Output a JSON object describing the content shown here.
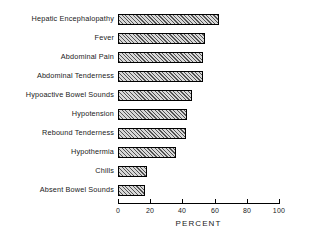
{
  "chart_data": {
    "type": "bar",
    "orientation": "horizontal",
    "title": "",
    "xlabel": "PERCENT",
    "ylabel": "",
    "xlim": [
      0,
      100
    ],
    "xticks": [
      0,
      20,
      40,
      60,
      80,
      100
    ],
    "xtick_labels": [
      "0",
      "20",
      "40",
      "60",
      "80",
      "100"
    ],
    "grid": false,
    "legend": false,
    "categories": [
      "Hepatic Encephalopathy",
      "Fever",
      "Abdominal Pain",
      "Abdominal Tenderness",
      "Hypoactive Bowel Sounds",
      "Hypotension",
      "Rebound Tenderness",
      "Hypothermia",
      "Chills",
      "Absent Bowel Sounds"
    ],
    "values": [
      63,
      54,
      53,
      53,
      46,
      43,
      42,
      36,
      18,
      17
    ],
    "bar_style": {
      "fill": "#d8d8d8",
      "hatch": "diagonal",
      "edge": "#000000"
    }
  }
}
